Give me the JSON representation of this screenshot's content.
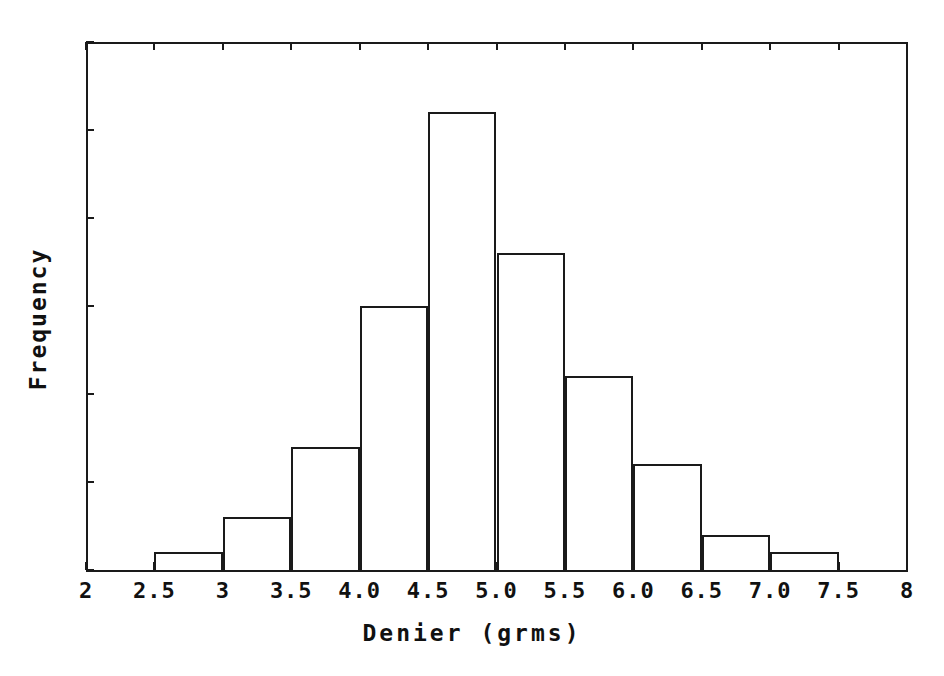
{
  "chart_data": {
    "type": "bar",
    "title": "",
    "xlabel": "Denier (grms)",
    "ylabel": "Frequency",
    "xlim": [
      2,
      8
    ],
    "ylim": [
      0,
      30
    ],
    "bin_width": 0.5,
    "grid": false,
    "legend": null,
    "x_tick_labels": [
      "2",
      "2.5",
      "3",
      "3.5",
      "4.0",
      "4.5",
      "5.0",
      "5.5",
      "6.0",
      "6.5",
      "7.0",
      "7.5",
      "8"
    ],
    "x_tick_values": [
      2,
      2.5,
      3,
      3.5,
      4,
      4.5,
      5,
      5.5,
      6,
      6.5,
      7,
      7.5,
      8
    ],
    "y_tick_labels": [
      "0",
      "5",
      "10",
      "15",
      "20",
      "25",
      "30"
    ],
    "y_tick_values": [
      0,
      5,
      10,
      15,
      20,
      25,
      30
    ],
    "categories": [
      "2.5-3.0",
      "3.0-3.5",
      "3.5-4.0",
      "4.0-4.5",
      "4.5-5.0",
      "5.0-5.5",
      "5.5-6.0",
      "6.0-6.5",
      "6.5-7.0",
      "7.0-7.5"
    ],
    "bins": [
      {
        "start": 2.5,
        "end": 3.0,
        "value": 1
      },
      {
        "start": 3.0,
        "end": 3.5,
        "value": 3
      },
      {
        "start": 3.5,
        "end": 4.0,
        "value": 7
      },
      {
        "start": 4.0,
        "end": 4.5,
        "value": 15
      },
      {
        "start": 4.5,
        "end": 5.0,
        "value": 26
      },
      {
        "start": 5.0,
        "end": 5.5,
        "value": 18
      },
      {
        "start": 5.5,
        "end": 6.0,
        "value": 11
      },
      {
        "start": 6.0,
        "end": 6.5,
        "value": 6
      },
      {
        "start": 6.5,
        "end": 7.0,
        "value": 2
      },
      {
        "start": 7.0,
        "end": 7.5,
        "value": 1
      }
    ],
    "values": [
      1,
      3,
      7,
      15,
      26,
      18,
      11,
      6,
      2,
      1
    ],
    "total_count": 90,
    "colors": {
      "bar_outline": "#1a1a1a",
      "bar_fill": "transparent",
      "axis": "#1a1a1a",
      "text": "#111111",
      "background": "#ffffff"
    }
  }
}
